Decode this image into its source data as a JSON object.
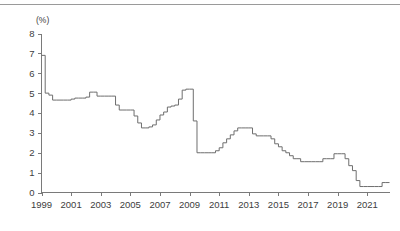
{
  "figure": {
    "unit_label": "(%)",
    "has_top_rule": true,
    "line_color": "#6e6e6e",
    "axis_color": "#7a7a7a",
    "background_color": "#ffffff"
  },
  "chart_data": {
    "type": "line",
    "title": "",
    "subtitle": "",
    "xlabel": "",
    "ylabel": "(%)",
    "unit": "%",
    "grid": false,
    "legend": null,
    "step": "post",
    "xlim": [
      1999.0,
      2022.5
    ],
    "ylim": [
      0,
      8
    ],
    "ytick_values": [
      0,
      1,
      2,
      3,
      4,
      5,
      6,
      7,
      8
    ],
    "ytick_labels": [
      "0",
      "1",
      "2",
      "3",
      "4",
      "5",
      "6",
      "7",
      "8"
    ],
    "xtick_values": [
      1999,
      2001,
      2003,
      2005,
      2007,
      2009,
      2011,
      2013,
      2015,
      2017,
      2019,
      2021
    ],
    "xtick_labels": [
      "1999",
      "2001",
      "2003",
      "2005",
      "2007",
      "2009",
      "2011",
      "2013",
      "2015",
      "2017",
      "2019",
      "2021"
    ],
    "series": [
      {
        "name": "rate",
        "x": [
          1999.0,
          1999.25,
          1999.5,
          1999.75,
          2000.0,
          2000.25,
          2000.5,
          2000.75,
          2001.0,
          2001.25,
          2001.5,
          2001.75,
          2002.0,
          2002.25,
          2002.5,
          2002.75,
          2003.0,
          2003.25,
          2003.5,
          2003.75,
          2004.0,
          2004.25,
          2004.5,
          2004.75,
          2005.0,
          2005.25,
          2005.5,
          2005.75,
          2006.0,
          2006.25,
          2006.5,
          2006.75,
          2007.0,
          2007.25,
          2007.5,
          2007.75,
          2008.0,
          2008.25,
          2008.5,
          2008.75,
          2009.0,
          2009.25,
          2009.5,
          2009.75,
          2010.0,
          2010.25,
          2010.5,
          2010.75,
          2011.0,
          2011.25,
          2011.5,
          2011.75,
          2012.0,
          2012.25,
          2012.5,
          2012.75,
          2013.0,
          2013.25,
          2013.5,
          2013.75,
          2014.0,
          2014.25,
          2014.5,
          2014.75,
          2015.0,
          2015.25,
          2015.5,
          2015.75,
          2016.0,
          2016.25,
          2016.5,
          2016.75,
          2017.0,
          2017.25,
          2017.5,
          2017.75,
          2018.0,
          2018.25,
          2018.5,
          2018.75,
          2019.0,
          2019.25,
          2019.5,
          2019.75,
          2020.0,
          2020.25,
          2020.5,
          2020.75,
          2021.0,
          2021.25,
          2021.5,
          2021.75,
          2022.0,
          2022.25
        ],
        "values": [
          6.9,
          5.0,
          4.9,
          4.65,
          4.65,
          4.65,
          4.65,
          4.65,
          4.7,
          4.75,
          4.75,
          4.75,
          4.8,
          5.05,
          5.05,
          4.85,
          4.85,
          4.85,
          4.85,
          4.85,
          4.4,
          4.15,
          4.15,
          4.15,
          4.15,
          3.85,
          3.5,
          3.25,
          3.25,
          3.3,
          3.4,
          3.65,
          3.9,
          4.05,
          4.3,
          4.35,
          4.4,
          4.7,
          5.15,
          5.2,
          5.2,
          3.6,
          2.0,
          2.0,
          2.0,
          2.0,
          2.0,
          2.1,
          2.25,
          2.5,
          2.7,
          2.9,
          3.1,
          3.25,
          3.25,
          3.25,
          3.25,
          2.95,
          2.85,
          2.85,
          2.85,
          2.85,
          2.7,
          2.45,
          2.3,
          2.1,
          2.0,
          1.85,
          1.7,
          1.7,
          1.55,
          1.55,
          1.55,
          1.55,
          1.55,
          1.55,
          1.7,
          1.7,
          1.7,
          1.95,
          1.95,
          1.95,
          1.7,
          1.35,
          1.1,
          0.6,
          0.3,
          0.3,
          0.3,
          0.3,
          0.3,
          0.3,
          0.5,
          0.5
        ]
      }
    ],
    "annotations": []
  }
}
